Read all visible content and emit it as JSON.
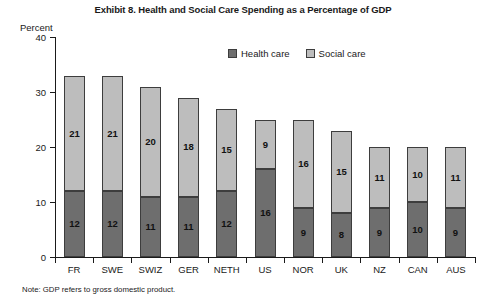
{
  "chart_data": {
    "type": "bar",
    "subtype": "stacked-vertical",
    "title": "Exhibit 8. Health and Social Care Spending as a Percentage of GDP",
    "xlabel": "",
    "ylabel": "Percent",
    "ylim": [
      0,
      40
    ],
    "yticks": [
      0,
      10,
      20,
      30,
      40
    ],
    "ytick_labels": [
      "0",
      "10",
      "20",
      "30",
      "40"
    ],
    "grid": false,
    "legend_position": "top-center",
    "categories": [
      "FR",
      "SWE",
      "SWIZ",
      "GER",
      "NETH",
      "US",
      "NOR",
      "UK",
      "NZ",
      "CAN",
      "AUS"
    ],
    "series": [
      {
        "name": "Health care",
        "color": "#6e6e6e",
        "values": [
          12,
          12,
          11,
          11,
          12,
          16,
          9,
          8,
          9,
          10,
          9
        ]
      },
      {
        "name": "Social care",
        "color": "#bdbdbd",
        "values": [
          21,
          21,
          20,
          18,
          15,
          9,
          16,
          15,
          11,
          10,
          11
        ]
      }
    ],
    "totals": [
      33,
      33,
      31,
      29,
      27,
      25,
      25,
      23,
      20,
      20,
      20
    ],
    "note": "Note: GDP refers to gross domestic product."
  },
  "legend": {
    "items": [
      {
        "label": "Health care",
        "swatch": "health"
      },
      {
        "label": "Social care",
        "swatch": "social"
      }
    ]
  }
}
